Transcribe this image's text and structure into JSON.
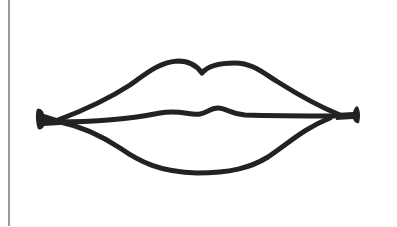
{
  "illustration": {
    "subject": "lips-line-drawing",
    "stroke_color": "#222222",
    "background_color": "#ffffff",
    "border_color": "#555555"
  }
}
